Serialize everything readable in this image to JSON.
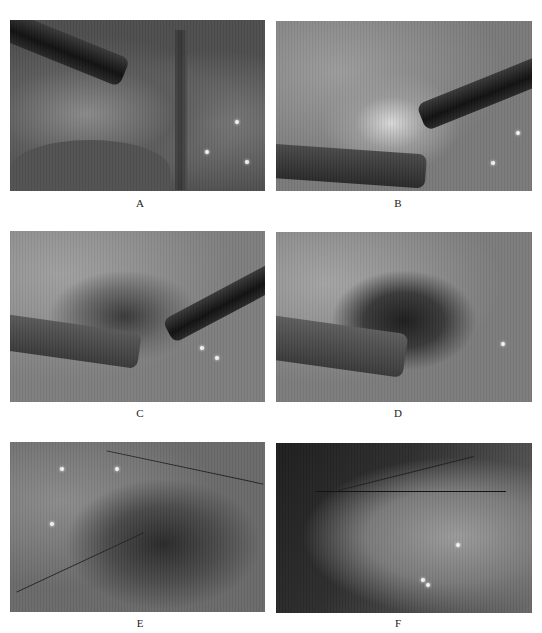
{
  "figure": {
    "panels": [
      {
        "id": "A",
        "label": "A",
        "description": "Laparoscopic view, instrument entering from upper left over dissected tissue"
      },
      {
        "id": "B",
        "label": "B",
        "description": "Two instruments, upper right and lower left, over exposed tissue"
      },
      {
        "id": "C",
        "label": "C",
        "description": "Instruments grasping cauterized tissue region"
      },
      {
        "id": "D",
        "label": "D",
        "description": "Dark cauterized tissue mass held by instrument from left"
      },
      {
        "id": "E",
        "label": "E",
        "description": "Close-up of cauterized tissue with suture lines across bowel loops"
      },
      {
        "id": "F",
        "label": "F",
        "description": "Sutured closure with thread crossing tissue fold"
      }
    ]
  }
}
